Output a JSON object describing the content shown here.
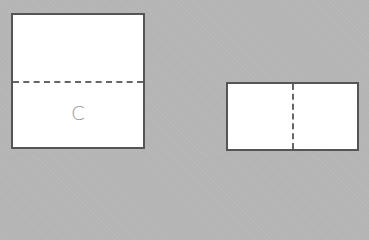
{
  "figures": [
    {
      "id": "square",
      "shape": "square",
      "fold_line": "horizontal-dashed",
      "label": "C"
    },
    {
      "id": "rectangle",
      "shape": "rectangle",
      "fold_line": "vertical-dashed",
      "label": ""
    }
  ],
  "colors": {
    "background": "#b4b4b4",
    "shape_fill": "#ffffff",
    "outline": "#555555",
    "dashed_line": "#666666",
    "label": "#9a9a9a"
  }
}
